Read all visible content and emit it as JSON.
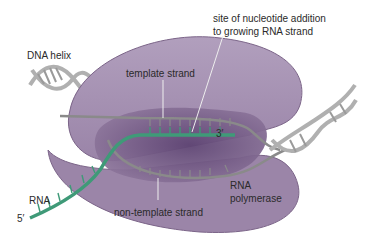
{
  "diagram": {
    "type": "transcription",
    "labels": {
      "dna_helix": "DNA helix",
      "template_strand": "template strand",
      "site_line1": "site of nucleotide addition",
      "site_line2": "to growing RNA strand",
      "three_prime": "3′",
      "rna": "RNA",
      "five_prime": "5′",
      "non_template_strand": "non-template strand",
      "polymerase_line1": "RNA",
      "polymerase_line2": "polymerase"
    },
    "colors": {
      "polymerase_light": "#a48fb0",
      "polymerase_mid": "#8e779c",
      "bubble_dark": "#6f5683",
      "rna_green": "#3f9a78",
      "dna_grey": "#b5b5b5",
      "text": "#2a2a2a"
    }
  }
}
